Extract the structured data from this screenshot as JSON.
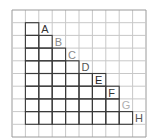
{
  "diagram": {
    "grid": {
      "cols": 10,
      "rows": 10,
      "x0": 12,
      "y0": 10,
      "cell_w": 13.4,
      "cell_h": 12.7,
      "line_color": "#c8c8c8",
      "border_color": "#9a9a9a"
    },
    "staircase": {
      "line_color": "#3a3a3a",
      "columns": [
        {
          "col": 1,
          "top_row": 1
        },
        {
          "col": 2,
          "top_row": 2
        },
        {
          "col": 3,
          "top_row": 3
        },
        {
          "col": 4,
          "top_row": 4
        },
        {
          "col": 5,
          "top_row": 5
        },
        {
          "col": 6,
          "top_row": 5
        },
        {
          "col": 7,
          "top_row": 6
        },
        {
          "col": 8,
          "top_row": 8
        }
      ],
      "bottom_row": 9
    },
    "labels": [
      {
        "text": "A",
        "col": 2,
        "row": 1,
        "color": "#333333"
      },
      {
        "text": "B",
        "col": 3,
        "row": 2,
        "color": "#8a8a8a"
      },
      {
        "text": "C",
        "col": 4,
        "row": 3,
        "color": "#8a8a8a"
      },
      {
        "text": "D",
        "col": 5,
        "row": 4,
        "color": "#555555"
      },
      {
        "text": "E",
        "col": 6,
        "row": 5,
        "color": "#222222"
      },
      {
        "text": "F",
        "col": 7,
        "row": 6,
        "color": "#333333"
      },
      {
        "text": "G",
        "col": 8,
        "row": 7,
        "color": "#b0b0b0"
      },
      {
        "text": "H",
        "col": 9,
        "row": 8,
        "color": "#555555"
      }
    ]
  }
}
